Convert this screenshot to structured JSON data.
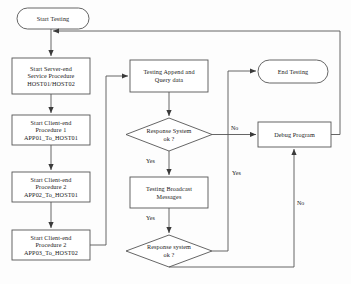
{
  "diagram": {
    "type": "flowchart",
    "nodes": [
      {
        "id": "start",
        "shape": "terminator",
        "lines": [
          "Start Testing"
        ]
      },
      {
        "id": "server",
        "shape": "process",
        "lines": [
          "Start Server-end",
          "Service Procedure",
          "HOST01/HOST02"
        ]
      },
      {
        "id": "client1",
        "shape": "process",
        "lines": [
          "Start Client-end",
          "Procedure 1",
          "APP01_To_HOST01"
        ]
      },
      {
        "id": "client2",
        "shape": "process",
        "lines": [
          "Start Client-end",
          "Procedure 2",
          "APP02_To_HOST01"
        ]
      },
      {
        "id": "client3",
        "shape": "process",
        "lines": [
          "Start Client-end",
          "Procedure 2",
          "APP03_To_HOST02"
        ]
      },
      {
        "id": "append",
        "shape": "process",
        "lines": [
          "Testing Append and",
          "Query data"
        ]
      },
      {
        "id": "decision1",
        "shape": "decision",
        "lines": [
          "Response System",
          "ok ?"
        ]
      },
      {
        "id": "broadcast",
        "shape": "process",
        "lines": [
          "Testing Broadcast",
          "Messages"
        ]
      },
      {
        "id": "decision2",
        "shape": "decision",
        "lines": [
          "Response system",
          "ok ?"
        ]
      },
      {
        "id": "end",
        "shape": "terminator",
        "lines": [
          "End Testing"
        ]
      },
      {
        "id": "debug",
        "shape": "process",
        "lines": [
          "Debug Program"
        ]
      }
    ],
    "edge_labels": [
      {
        "id": "d1-no",
        "text": "No",
        "from": "decision1",
        "to": "debug"
      },
      {
        "id": "d1-yes",
        "text": "Yes",
        "from": "decision1",
        "to": "broadcast"
      },
      {
        "id": "bc-yes",
        "text": "Yes",
        "from": "broadcast",
        "to": "decision2"
      },
      {
        "id": "d2-yes",
        "text": "Yes",
        "from": "decision2",
        "to": "end"
      },
      {
        "id": "d2-no",
        "text": "No",
        "from": "decision2",
        "to": "debug"
      }
    ],
    "colors": {
      "stroke": "#4a4a4a",
      "node_fill": "#ffffff",
      "text": "#1a1a1a",
      "background": "#fdfdfd"
    }
  }
}
